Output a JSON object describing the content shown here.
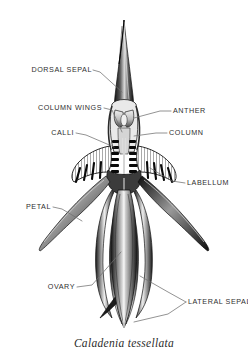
{
  "figure": {
    "caption": "Caladenia tessellata",
    "background_color": "#ffffff",
    "ink_color": "#1a1a1a",
    "leader_color": "#6f6f6f",
    "label_color": "#2f2f2f"
  },
  "labels": {
    "dorsal_sepal": "DORSAL SEPAL",
    "column_wings": "COLUMN WINGS",
    "calli": "CALLI",
    "anther": "ANTHER",
    "column": "COLUMN",
    "labellum": "LABELLUM",
    "petal": "PETAL",
    "ovary": "OVARY",
    "lateral_sepals": "LATERAL SEPALS"
  }
}
